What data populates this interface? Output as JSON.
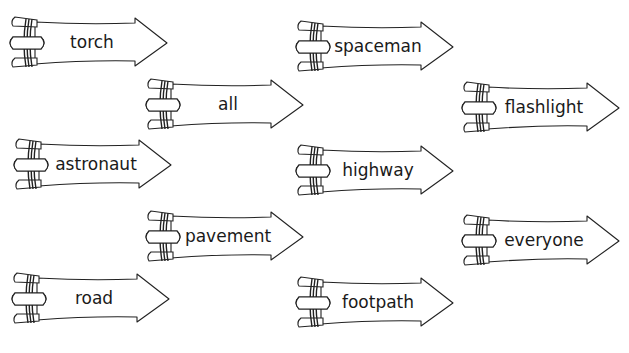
{
  "colors": {
    "stroke": "#222222",
    "fill": "#ffffff",
    "text": "#1a1a1a"
  },
  "arrows": [
    {
      "word": "torch",
      "x": 7,
      "y": 14
    },
    {
      "word": "all",
      "x": 143,
      "y": 76
    },
    {
      "word": "spaceman",
      "x": 293,
      "y": 18
    },
    {
      "word": "flashlight",
      "x": 459,
      "y": 79
    },
    {
      "word": "astronaut",
      "x": 11,
      "y": 136
    },
    {
      "word": "highway",
      "x": 293,
      "y": 142
    },
    {
      "word": "pavement",
      "x": 143,
      "y": 208
    },
    {
      "word": "everyone",
      "x": 459,
      "y": 212
    },
    {
      "word": "road",
      "x": 9,
      "y": 270
    },
    {
      "word": "footpath",
      "x": 293,
      "y": 274
    }
  ]
}
